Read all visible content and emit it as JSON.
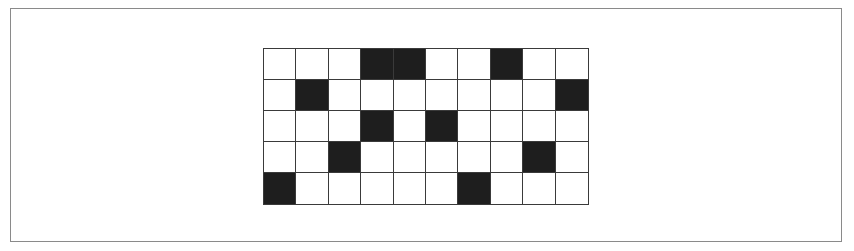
{
  "diagram": {
    "type": "binary-grid",
    "rows": 5,
    "cols": 10,
    "colors": {
      "filled": "#1e1e1e",
      "empty": "#ffffff",
      "line": "#3a3a3a",
      "frame": "#8a8a8a"
    },
    "filled_cells": [
      [
        0,
        3
      ],
      [
        0,
        4
      ],
      [
        0,
        7
      ],
      [
        1,
        1
      ],
      [
        1,
        9
      ],
      [
        2,
        3
      ],
      [
        2,
        5
      ],
      [
        3,
        2
      ],
      [
        3,
        8
      ],
      [
        4,
        0
      ],
      [
        4,
        6
      ]
    ],
    "matrix": [
      [
        0,
        0,
        0,
        1,
        1,
        0,
        0,
        1,
        0,
        0
      ],
      [
        0,
        1,
        0,
        0,
        0,
        0,
        0,
        0,
        0,
        1
      ],
      [
        0,
        0,
        0,
        1,
        0,
        1,
        0,
        0,
        0,
        0
      ],
      [
        0,
        0,
        1,
        0,
        0,
        0,
        0,
        0,
        1,
        0
      ],
      [
        1,
        0,
        0,
        0,
        0,
        0,
        1,
        0,
        0,
        0
      ]
    ]
  }
}
